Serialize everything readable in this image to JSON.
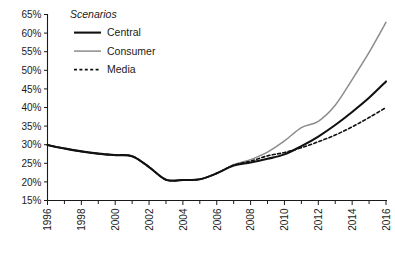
{
  "chart_data": {
    "type": "line",
    "title": "",
    "subtitle": "",
    "xlabel": "",
    "ylabel": "",
    "xlim": [
      1996,
      2016
    ],
    "ylim": [
      15,
      65
    ],
    "grid": false,
    "legend_title": "Scenarios",
    "legend_position": "top-left-inside",
    "y_ticks": [
      15,
      20,
      25,
      30,
      35,
      40,
      45,
      50,
      55,
      60,
      65
    ],
    "y_tick_labels": [
      "15%",
      "20%",
      "25%",
      "30%",
      "35%",
      "40%",
      "45%",
      "50%",
      "55%",
      "60%",
      "65%"
    ],
    "x_ticks": [
      1996,
      1998,
      2000,
      2002,
      2004,
      2006,
      2008,
      2010,
      2012,
      2014,
      2016
    ],
    "x_tick_labels": [
      "1996",
      "1998",
      "2000",
      "2002",
      "2004",
      "2006",
      "2008",
      "2010",
      "2012",
      "2014",
      "2016"
    ],
    "x_minor_ticks": [
      1997,
      1999,
      2001,
      2003,
      2005,
      2007,
      2009,
      2011,
      2013,
      2015
    ],
    "x": [
      1996,
      1997,
      1998,
      1999,
      2000,
      2001,
      2002,
      2003,
      2004,
      2005,
      2006,
      2007,
      2008,
      2009,
      2010,
      2011,
      2012,
      2013,
      2014,
      2015,
      2016
    ],
    "series": [
      {
        "name": "Central",
        "color": "#111111",
        "width": 2.1,
        "dash": "none",
        "values": [
          29.9,
          29.0,
          28.2,
          27.6,
          27.2,
          26.9,
          24.0,
          20.6,
          20.5,
          20.7,
          22.3,
          24.4,
          25.2,
          26.2,
          27.4,
          29.6,
          32.2,
          35.3,
          38.8,
          42.6,
          47.0
        ]
      },
      {
        "name": "Consumer",
        "color": "#8c8c8c",
        "width": 1.5,
        "dash": "none",
        "values": [
          29.9,
          29.0,
          28.2,
          27.6,
          27.2,
          26.9,
          24.0,
          20.6,
          20.5,
          20.7,
          22.3,
          24.6,
          26.0,
          28.0,
          31.0,
          34.6,
          36.3,
          40.6,
          47.5,
          54.8,
          62.9
        ]
      },
      {
        "name": "Media",
        "color": "#111111",
        "width": 1.6,
        "dash": "3,2.4",
        "values": [
          29.9,
          29.0,
          28.2,
          27.6,
          27.2,
          26.9,
          24.0,
          20.6,
          20.5,
          20.7,
          22.3,
          24.5,
          25.6,
          27.0,
          27.9,
          29.2,
          30.8,
          32.6,
          34.8,
          37.3,
          40.0
        ]
      }
    ]
  },
  "legend": {
    "title": "Scenarios",
    "items": [
      {
        "label": "Central",
        "color": "#111111",
        "dash": "none",
        "width": 2.1
      },
      {
        "label": "Consumer",
        "color": "#8c8c8c",
        "dash": "none",
        "width": 1.5
      },
      {
        "label": "Media",
        "color": "#111111",
        "dash": "3,2.4",
        "width": 1.6
      }
    ]
  }
}
